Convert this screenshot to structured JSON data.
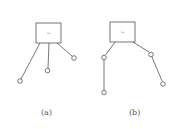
{
  "diagrams": [
    {
      "id": "a",
      "label": "(a)",
      "box_symbol": "~"
    },
    {
      "id": "b",
      "label": "(b)",
      "box_symbol": "~"
    }
  ],
  "colors": {
    "stroke": "#555555",
    "background": "#ffffff"
  }
}
